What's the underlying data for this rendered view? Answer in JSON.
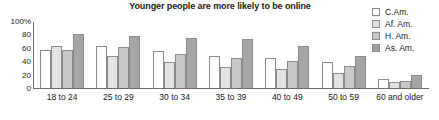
{
  "chart_data": {
    "type": "bar",
    "title": "Younger people are more likely to be online",
    "subtitle": "",
    "xlabel": "",
    "ylabel": "",
    "ylim": [
      0,
      100
    ],
    "yticks": [
      "0",
      "20",
      "40",
      "60",
      "80",
      "100%"
    ],
    "ytick_values": [
      0,
      20,
      40,
      60,
      80,
      100
    ],
    "grid": false,
    "legend_position": "top-right",
    "categories": [
      "18 to 24",
      "25 to 29",
      "30 to 34",
      "35 to 39",
      "40 to 49",
      "50 to 59",
      "60 and older"
    ],
    "series": [
      {
        "name": "C.Am.",
        "color": "#ffffff",
        "values": [
          58,
          64,
          56,
          49,
          46,
          40,
          13
        ]
      },
      {
        "name": "Af. Am.",
        "color": "#e3e3e3",
        "values": [
          64,
          49,
          39,
          32,
          29,
          23,
          9
        ]
      },
      {
        "name": "H. Am.",
        "color": "#c8c8c8",
        "values": [
          57,
          62,
          52,
          46,
          41,
          34,
          11
        ]
      },
      {
        "name": "As. Am.",
        "color": "#a6a6a6",
        "values": [
          82,
          79,
          76,
          75,
          63,
          48,
          19
        ]
      }
    ]
  },
  "axis": {
    "line_color": "#6d6d6d"
  },
  "colors": {
    "text": "#1a1a1a",
    "bar_border": "#8a8a8a",
    "series_1": "#ffffff",
    "series_2": "#e3e3e3",
    "series_3": "#c8c8c8",
    "series_4": "#a6a6a6"
  }
}
